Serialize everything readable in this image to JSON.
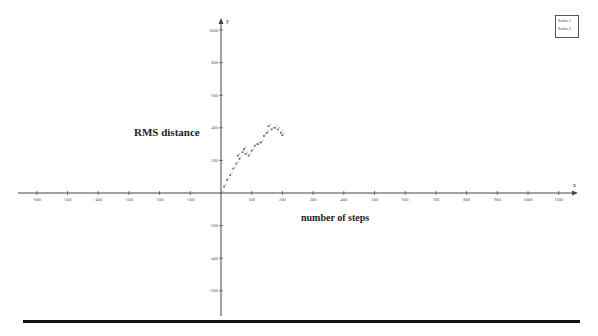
{
  "chart_data": {
    "type": "scatter",
    "title": "",
    "xlabel": "number of steps",
    "ylabel": "RMS distance",
    "x_axis_name": "x",
    "y_axis_name": "y",
    "xlim": [
      -600,
      1150
    ],
    "ylim": [
      -650,
      1050
    ],
    "x_ticks": [
      -600,
      -500,
      -400,
      -300,
      -200,
      -100,
      100,
      200,
      300,
      400,
      500,
      600,
      700,
      800,
      900,
      1000,
      1100
    ],
    "y_ticks": [
      -600,
      -400,
      -200,
      200,
      400,
      600,
      800,
      1000
    ],
    "grid": false,
    "legend_position": "top-right",
    "series": [
      {
        "name": "Series 1",
        "x": [
          0,
          10,
          20,
          30,
          40,
          50,
          55,
          60,
          70,
          75,
          80,
          90,
          100,
          110,
          120,
          130,
          140,
          150,
          155,
          165,
          175,
          185,
          195,
          200
        ],
        "values": [
          0,
          40,
          80,
          110,
          150,
          180,
          230,
          210,
          250,
          270,
          240,
          230,
          260,
          290,
          300,
          310,
          350,
          370,
          410,
          390,
          400,
          390,
          370,
          355
        ]
      },
      {
        "name": "Series 2",
        "x": [],
        "values": []
      }
    ],
    "colors": {
      "points": "#666666",
      "axes": "#444444"
    }
  },
  "legend": {
    "items": [
      "Series 1",
      "Series 2"
    ]
  }
}
